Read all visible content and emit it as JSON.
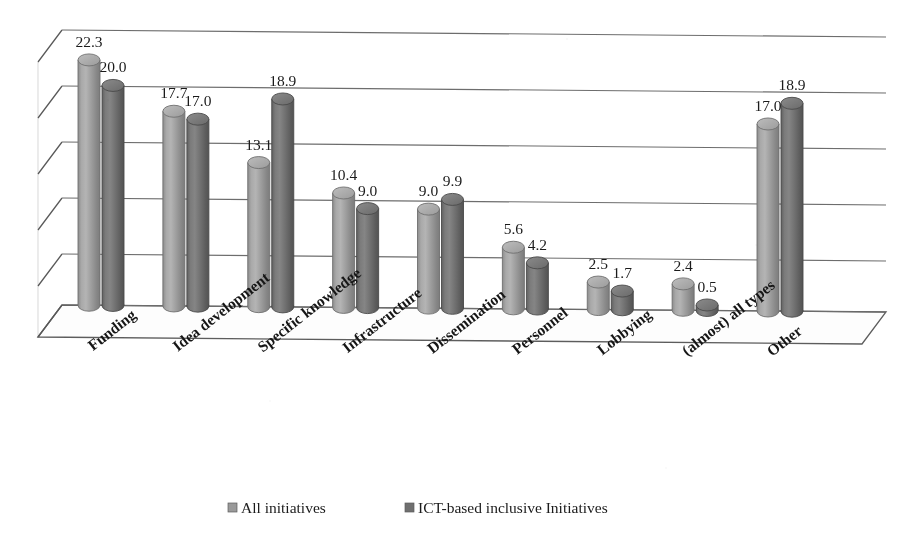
{
  "chart_data": {
    "type": "bar",
    "title": "",
    "subtitle": "",
    "xlabel": "",
    "ylabel": "",
    "ylim": [
      0,
      25
    ],
    "yticks": [
      0,
      5,
      10,
      15,
      20,
      25
    ],
    "grid": true,
    "legend_position": "bottom",
    "style": "3d-cylinder-clustered",
    "categories": [
      "Funding",
      "Idea development",
      "Specific knowledge",
      "Infrastructure",
      "Dissemination",
      "Personnel",
      "Lobbying",
      "(almost) all types",
      "Other"
    ],
    "series": [
      {
        "name": "All initiatives",
        "color": "#9a9a9a",
        "values": [
          22.3,
          17.7,
          13.1,
          10.4,
          9.0,
          5.6,
          2.5,
          2.4,
          17.0
        ],
        "labels": [
          "22.3",
          "17.7",
          "13.1",
          "10.4",
          "9.0",
          "5.6",
          "2.5",
          "2.4",
          "17.0"
        ]
      },
      {
        "name": "ICT-based inclusive Initiatives",
        "color": "#6f6f6f",
        "values": [
          20.0,
          17.0,
          18.9,
          9.0,
          9.9,
          4.2,
          1.7,
          0.5,
          18.9
        ],
        "labels": [
          "20.0",
          "17.0",
          "18.9",
          "9.0",
          "9.9",
          "4.2",
          "1.7",
          "0.5",
          "18.9"
        ]
      }
    ]
  },
  "legend": {
    "items": [
      {
        "label": "All initiatives",
        "marker_color": "#9a9a9a"
      },
      {
        "label": "ICT-based inclusive Initiatives",
        "marker_color": "#6f6f6f"
      }
    ]
  },
  "colors": {
    "series_1": "#9a9a9a",
    "series_2": "#6f6f6f",
    "gridline": "#6d6d6d",
    "frame": "#585858",
    "text": "#1b1b1b",
    "background": "#ffffff"
  }
}
